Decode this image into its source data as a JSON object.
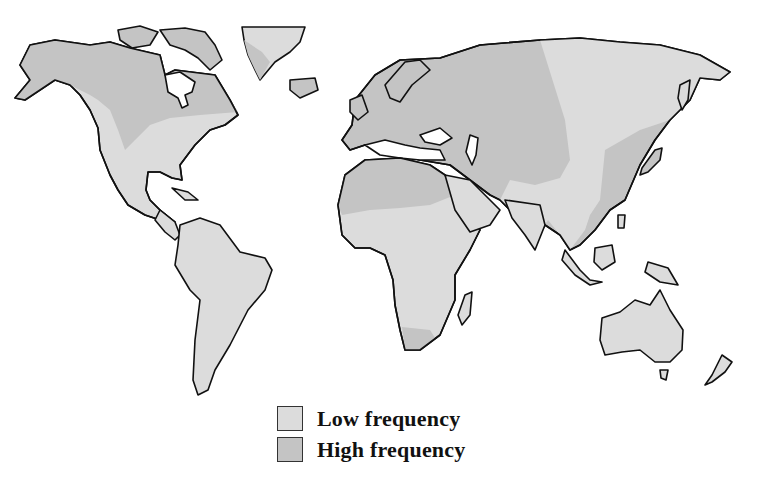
{
  "map": {
    "title": "World map of frequency distribution",
    "colors": {
      "low": "#dcdcdc",
      "high": "#c4c4c4",
      "outline": "#111111",
      "background": "#ffffff"
    },
    "regions": [
      {
        "name": "North America (north/central)",
        "frequency": "high"
      },
      {
        "name": "North America (south/east)",
        "frequency": "low"
      },
      {
        "name": "Greenland",
        "frequency": "low"
      },
      {
        "name": "South America",
        "frequency": "low"
      },
      {
        "name": "Europe",
        "frequency": "high"
      },
      {
        "name": "Northern Africa",
        "frequency": "high"
      },
      {
        "name": "Sub-Saharan Africa",
        "frequency": "low"
      },
      {
        "name": "Southern tip of Africa",
        "frequency": "high"
      },
      {
        "name": "Central/Western Asia",
        "frequency": "high"
      },
      {
        "name": "Eastern Siberia",
        "frequency": "low"
      },
      {
        "name": "East Asia (China)",
        "frequency": "high"
      },
      {
        "name": "South/Southeast Asia",
        "frequency": "low"
      },
      {
        "name": "Australia",
        "frequency": "low"
      },
      {
        "name": "New Zealand",
        "frequency": "low"
      }
    ]
  },
  "legend": {
    "items": [
      {
        "label": "Low frequency",
        "color": "#dcdcdc"
      },
      {
        "label": "High frequency",
        "color": "#c4c4c4"
      }
    ]
  }
}
